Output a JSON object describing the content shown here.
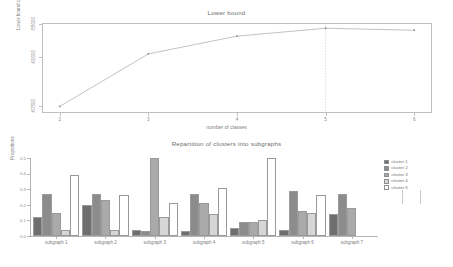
{
  "chart_data": [
    {
      "type": "line",
      "title": "Lower bound",
      "xlabel": "number of classes",
      "ylabel": "Lower bound criterion",
      "x": [
        2,
        3,
        4,
        5,
        6
      ],
      "values": [
        -67500,
        -59500,
        -56800,
        -55600,
        -55900
      ],
      "xticklabels": [
        "2",
        "3",
        "4",
        "5",
        "6"
      ],
      "yticklabels": [
        "-67500",
        "-60000",
        "-55000"
      ],
      "ylim": [
        -68500,
        -54800
      ],
      "xlim": [
        1.8,
        6.2
      ],
      "grid": false,
      "legend": "none",
      "annotations": [
        "dashed vertical line at x = 5 (selected number of classes)"
      ],
      "marker": "point",
      "line_color": "#a8a8a8"
    },
    {
      "type": "bar",
      "title": "Repartition of clusters into subgraphs",
      "xlabel": "",
      "ylabel": "Proportions",
      "categories": [
        "subgraph 1",
        "subgraph 2",
        "subgraph 3",
        "subgraph 4",
        "subgraph 5",
        "subgraph 6",
        "subgraph 7"
      ],
      "yticklabels": [
        "0.0",
        "0.1",
        "0.2",
        "0.3",
        "0.4",
        "0.5"
      ],
      "ylim": [
        0.0,
        0.5
      ],
      "grid": false,
      "legend": "right",
      "series": [
        {
          "name": "cluster 1",
          "color": "#6e6e6e",
          "values": [
            0.12,
            0.2,
            0.04,
            0.03,
            0.05,
            0.04,
            0.14
          ]
        },
        {
          "name": "cluster 2",
          "color": "#8c8c8c",
          "values": [
            0.27,
            0.27,
            0.03,
            0.27,
            0.09,
            0.29,
            0.27
          ]
        },
        {
          "name": "cluster 3",
          "color": "#aaaaaa",
          "values": [
            0.15,
            0.23,
            0.5,
            0.21,
            0.09,
            0.16,
            0.18
          ]
        },
        {
          "name": "cluster 4",
          "color": "#d6d6d6",
          "values": [
            0.04,
            0.04,
            0.12,
            0.14,
            0.1,
            0.15,
            0.0
          ]
        },
        {
          "name": "cluster 5",
          "color": "#ffffff",
          "values": [
            0.39,
            0.26,
            0.21,
            0.31,
            0.5,
            0.26,
            0.0
          ]
        }
      ]
    }
  ],
  "top": {
    "title": "Lower bound",
    "xlabel": "number of classes",
    "ylabel": "Lower bound criterion"
  },
  "bottom": {
    "title": "Repartition of clusters into subgraphs",
    "ylabel": "Proportions"
  }
}
